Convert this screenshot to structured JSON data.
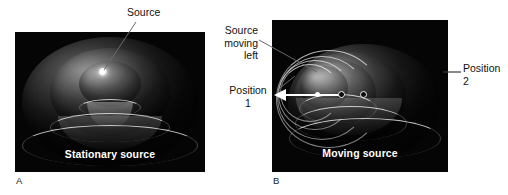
{
  "figure": {
    "background_color": "#ffffff",
    "panel_background_color": "#050505",
    "caption_color": "#ffffff",
    "label_color": "#111111"
  },
  "panels": [
    {
      "letter": "A",
      "caption": "Stationary source",
      "callouts": [
        {
          "name": "source",
          "text": "Source"
        }
      ]
    },
    {
      "letter": "B",
      "caption": "Moving source",
      "callouts": [
        {
          "name": "source-moving-left",
          "text": "Source moving left"
        },
        {
          "name": "position-1",
          "text": "Position 1"
        },
        {
          "name": "position-2",
          "text": "Position 2"
        }
      ]
    }
  ],
  "labels": {
    "source": "Source",
    "source_moving_left_line1": "Source",
    "source_moving_left_line2": "moving",
    "source_moving_left_line3": "left",
    "position1_line1": "Position",
    "position1_line2": "1",
    "position2_line1": "Position",
    "position2_line2": "2",
    "caption_a": "Stationary source",
    "caption_b": "Moving source",
    "letter_a": "A",
    "letter_b": "B"
  }
}
